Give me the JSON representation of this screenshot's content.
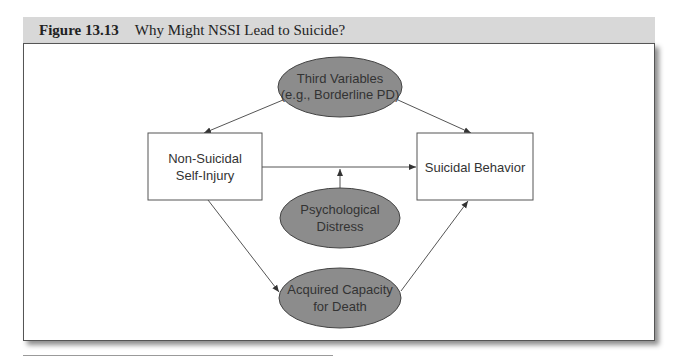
{
  "figure": {
    "number": "Figure 13.13",
    "title": "Why Might NSSI Lead to Suicide?"
  },
  "nodes": {
    "third_variables": {
      "line1": "Third Variables",
      "line2": "(e.g., Borderline PD)",
      "shape": "ellipse"
    },
    "nssi": {
      "line1": "Non-Suicidal",
      "line2": "Self-Injury",
      "shape": "rectangle"
    },
    "suicidal_behavior": {
      "line1": "Suicidal Behavior",
      "shape": "rectangle"
    },
    "psychological_distress": {
      "line1": "Psychological",
      "line2": "Distress",
      "shape": "ellipse"
    },
    "acquired_capacity": {
      "line1": "Acquired Capacity",
      "line2": "for Death",
      "shape": "ellipse"
    }
  },
  "edges": [
    {
      "from": "Third Variables",
      "to": "Non-Suicidal Self-Injury"
    },
    {
      "from": "Third Variables",
      "to": "Suicidal Behavior"
    },
    {
      "from": "Non-Suicidal Self-Injury",
      "to": "Suicidal Behavior"
    },
    {
      "from": "Psychological Distress",
      "to": "NSSI→Suicidal Behavior path (moderator)"
    },
    {
      "from": "Non-Suicidal Self-Injury",
      "to": "Acquired Capacity for Death"
    },
    {
      "from": "Acquired Capacity for Death",
      "to": "Suicidal Behavior"
    }
  ],
  "colors": {
    "ellipse_fill": "#8c8c8c",
    "caption_bg": "#d8d8d8",
    "line": "#444444"
  }
}
